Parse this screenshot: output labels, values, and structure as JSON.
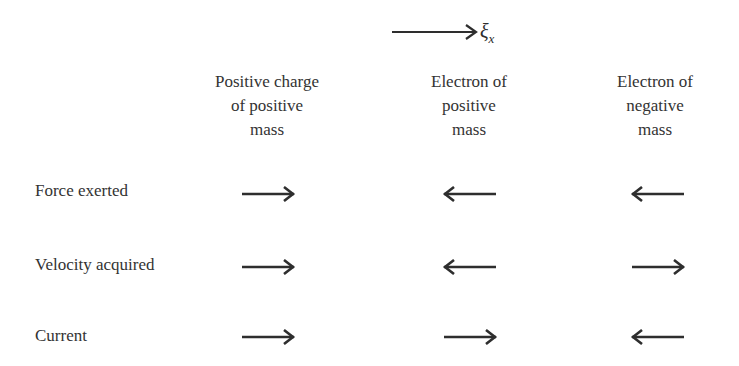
{
  "field": {
    "label": "ξ",
    "subscript": "x",
    "direction": "right"
  },
  "columns": [
    {
      "label": "Positive charge of positive mass",
      "lines": [
        "Positive charge",
        "of positive",
        "mass"
      ]
    },
    {
      "label": "Electron of positive mass",
      "lines": [
        "Electron of",
        "positive",
        "mass"
      ]
    },
    {
      "label": "Electron of negative mass",
      "lines": [
        "Electron of",
        "negative",
        "mass"
      ]
    }
  ],
  "rows": [
    {
      "label": "Force exerted",
      "arrows": [
        "right",
        "left",
        "left"
      ]
    },
    {
      "label": "Velocity acquired",
      "arrows": [
        "right",
        "left",
        "right"
      ]
    },
    {
      "label": "Current",
      "arrows": [
        "right",
        "right",
        "left"
      ]
    }
  ],
  "colors": {
    "ink": "#2e2e2e",
    "background": "#ffffff"
  }
}
